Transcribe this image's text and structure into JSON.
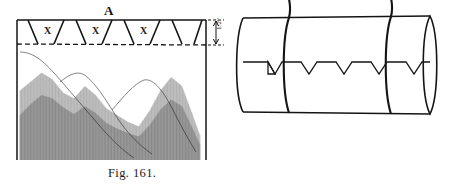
{
  "plate": {
    "kind": "engraving-plate",
    "figures": [
      {
        "id": "fig-161",
        "caption": "Fig. 161.",
        "part_label": "A",
        "band_marks": [
          "X",
          "X",
          "X"
        ],
        "dimension_label": "1/2\"",
        "description_tokens": {
          "band": "dovetail-band",
          "boundary": "dashed-line",
          "field": "vertical-hatched-field"
        }
      },
      {
        "id": "fig-162",
        "caption": "Fig. 162.",
        "description_tokens": {
          "body": "cylinder",
          "seam": "zigzag-lacing-seam",
          "straps": 2
        }
      }
    ]
  },
  "chart_data": {
    "type": "line",
    "title": "Fig. 161.",
    "xlabel": "",
    "ylabel": "",
    "grid": false,
    "legend": null,
    "x": [
      0,
      6,
      12,
      18,
      24,
      30,
      36,
      42,
      48,
      54,
      60,
      66,
      72,
      78,
      84,
      90,
      96,
      100
    ],
    "series": [
      {
        "name": "profile-outline",
        "values": [
          62,
          70,
          78,
          72,
          60,
          55,
          66,
          58,
          46,
          40,
          34,
          30,
          44,
          62,
          74,
          66,
          40,
          22
        ]
      },
      {
        "name": "inner-ridge",
        "values": [
          40,
          50,
          58,
          55,
          47,
          41,
          48,
          42,
          33,
          28,
          24,
          21,
          31,
          45,
          54,
          48,
          28,
          14
        ]
      }
    ],
    "ylim": [
      0,
      100
    ],
    "xlim": [
      0,
      100
    ]
  },
  "colors": {
    "ink": "#141414",
    "hatch": "#3b3b3b",
    "paper": "#ffffff"
  }
}
